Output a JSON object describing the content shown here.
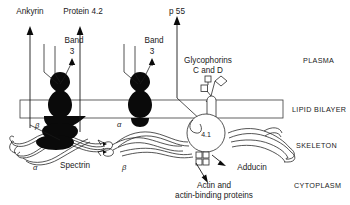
{
  "figure": {
    "background": "#ffffff",
    "ink": "#1a1a1a"
  },
  "callout_labels": {
    "ankyrin": "Ankyrin",
    "protein42": "Protein 4.2",
    "band3_left": "Band",
    "band3_left_num": "3",
    "band3_right": "Band",
    "band3_right_num": "3",
    "p55": "p 55",
    "glycophorins_line1": "Glycophorins",
    "glycophorins_line2": "C and D",
    "adducin": "Adducin",
    "actin_line1": "Actin and",
    "actin_line2": "actin-binding proteins",
    "spectrin": "Spectrin",
    "protein41": "4.1"
  },
  "greek_labels": {
    "beta_upper_left": "β",
    "alpha_lower_left": "α",
    "alpha_mid": "α",
    "beta_mid": "β"
  },
  "zone_labels": {
    "plasma": "PLASMA",
    "lipid_bilayer": "LIPID BILAYER",
    "skeleton": "SKELETON",
    "cytoplasm": "CYTOPLASM"
  }
}
